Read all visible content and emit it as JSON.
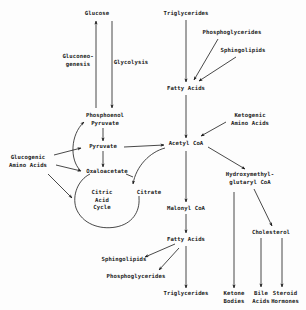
{
  "diagram": {
    "nodes": {
      "glucose": {
        "lines": [
          "Glucose"
        ]
      },
      "gluconeogenesis": {
        "lines": [
          "Gluconeo-",
          "genesis"
        ]
      },
      "glycolysis": {
        "lines": [
          "Glycolysis"
        ]
      },
      "pep": {
        "lines": [
          "Phosphoenol",
          "Pyruvate"
        ]
      },
      "pyruvate": {
        "lines": [
          "Pyruvate"
        ]
      },
      "oxaloacetate": {
        "lines": [
          "Oxaloacetate"
        ]
      },
      "citric_acid_cycle": {
        "lines": [
          "Citric",
          "Acid",
          "Cycle"
        ]
      },
      "citrate": {
        "lines": [
          "Citrate"
        ]
      },
      "glucogenic_aa": {
        "lines": [
          "Glucogenic",
          "Amino Acids"
        ]
      },
      "triglycerides_top": {
        "lines": [
          "Triglycerides"
        ]
      },
      "phosphoglycerides_top": {
        "lines": [
          "Phosphoglycerides"
        ]
      },
      "sphingolipids_top": {
        "lines": [
          "Sphingolipids"
        ]
      },
      "fatty_acids_top": {
        "lines": [
          "Fatty Acids"
        ]
      },
      "ketogenic_aa": {
        "lines": [
          "Ketogenic",
          "Amino Acids"
        ]
      },
      "acetyl_coa": {
        "lines": [
          "Acetyl CoA"
        ]
      },
      "hmg_coa": {
        "lines": [
          "Hydroxymethyl-",
          "glutaryl CoA"
        ]
      },
      "malonyl_coa": {
        "lines": [
          "Malonyl CoA"
        ]
      },
      "fatty_acids_bottom": {
        "lines": [
          "Fatty Acids"
        ]
      },
      "sphingolipids_bottom": {
        "lines": [
          "Sphingolipids"
        ]
      },
      "phosphoglycerides_bottom": {
        "lines": [
          "Phosphoglycerides"
        ]
      },
      "triglycerides_bottom": {
        "lines": [
          "Triglycerides"
        ]
      },
      "ketone_bodies": {
        "lines": [
          "Ketone",
          "Bodies"
        ]
      },
      "cholesterol": {
        "lines": [
          "Cholesterol"
        ]
      },
      "bile_acids": {
        "lines": [
          "Bile",
          "Acids"
        ]
      },
      "steroid_hormones": {
        "lines": [
          "Steroid",
          "Hormones"
        ]
      }
    },
    "edges": [
      {
        "from": "pep",
        "to": "glucose",
        "label": "Gluconeogenesis"
      },
      {
        "from": "glucose",
        "to": "pep",
        "label": "Glycolysis"
      },
      {
        "from": "pep",
        "to": "pyruvate"
      },
      {
        "from": "pyruvate",
        "to": "oxaloacetate"
      },
      {
        "from": "pyruvate",
        "to": "acetyl_coa"
      },
      {
        "from": "oxaloacetate",
        "to": "pep"
      },
      {
        "from": "glucogenic_aa",
        "to": "pyruvate"
      },
      {
        "from": "glucogenic_aa",
        "to": "oxaloacetate"
      },
      {
        "from": "glucogenic_aa",
        "to": "citric_acid_cycle"
      },
      {
        "from": "acetyl_coa",
        "to": "citrate"
      },
      {
        "from": "citrate",
        "to": "oxaloacetate",
        "via": "citric_acid_cycle"
      },
      {
        "from": "triglycerides_top",
        "to": "fatty_acids_top"
      },
      {
        "from": "phosphoglycerides_top",
        "to": "fatty_acids_top"
      },
      {
        "from": "sphingolipids_top",
        "to": "fatty_acids_top"
      },
      {
        "from": "fatty_acids_top",
        "to": "acetyl_coa"
      },
      {
        "from": "ketogenic_aa",
        "to": "acetyl_coa"
      },
      {
        "from": "acetyl_coa",
        "to": "malonyl_coa"
      },
      {
        "from": "acetyl_coa",
        "to": "hmg_coa"
      },
      {
        "from": "malonyl_coa",
        "to": "fatty_acids_bottom"
      },
      {
        "from": "fatty_acids_bottom",
        "to": "sphingolipids_bottom"
      },
      {
        "from": "fatty_acids_bottom",
        "to": "phosphoglycerides_bottom"
      },
      {
        "from": "fatty_acids_bottom",
        "to": "triglycerides_bottom"
      },
      {
        "from": "hmg_coa",
        "to": "ketone_bodies"
      },
      {
        "from": "hmg_coa",
        "to": "cholesterol"
      },
      {
        "from": "cholesterol",
        "to": "bile_acids"
      },
      {
        "from": "cholesterol",
        "to": "steroid_hormones"
      }
    ],
    "colors": {
      "ink": "#1a1a1a",
      "background": "#fdfdfd"
    }
  }
}
